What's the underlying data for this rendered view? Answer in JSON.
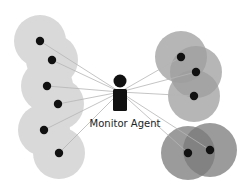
{
  "diagram": {
    "agent": {
      "label": "Monitor Agent",
      "icon": "person-icon",
      "x": 120,
      "head_y": 81,
      "body_top": 89,
      "body_bottom": 111
    },
    "colors": {
      "left_range": "#d9d9d9",
      "right_range": "#a6a6a6",
      "bottom_range": "#8c8c8c",
      "node": "#111111",
      "link": "#b5b5b5",
      "agent": "#111111"
    },
    "groups": [
      {
        "name": "left-group",
        "fill": "#d9d9d9",
        "opacity": 1,
        "radius": 26,
        "nodes": [
          [
            40,
            41
          ],
          [
            52,
            60
          ],
          [
            47,
            86
          ],
          [
            58,
            104
          ],
          [
            44,
            130
          ],
          [
            59,
            153
          ]
        ]
      },
      {
        "name": "right-group",
        "fill": "#9e9e9e",
        "opacity": 0.75,
        "radius": 26,
        "nodes": [
          [
            181,
            57
          ],
          [
            196,
            72
          ],
          [
            194,
            96
          ]
        ]
      },
      {
        "name": "bottom-right-group",
        "fill": "#7a7a7a",
        "opacity": 0.75,
        "radius": 27,
        "nodes": [
          [
            188,
            153
          ],
          [
            210,
            150
          ]
        ]
      }
    ],
    "links_from_agent": [
      [
        40,
        41
      ],
      [
        52,
        60
      ],
      [
        47,
        86
      ],
      [
        58,
        104
      ],
      [
        44,
        130
      ],
      [
        59,
        153
      ],
      [
        181,
        57
      ],
      [
        196,
        72
      ],
      [
        194,
        96
      ],
      [
        188,
        153
      ],
      [
        210,
        150
      ]
    ]
  }
}
